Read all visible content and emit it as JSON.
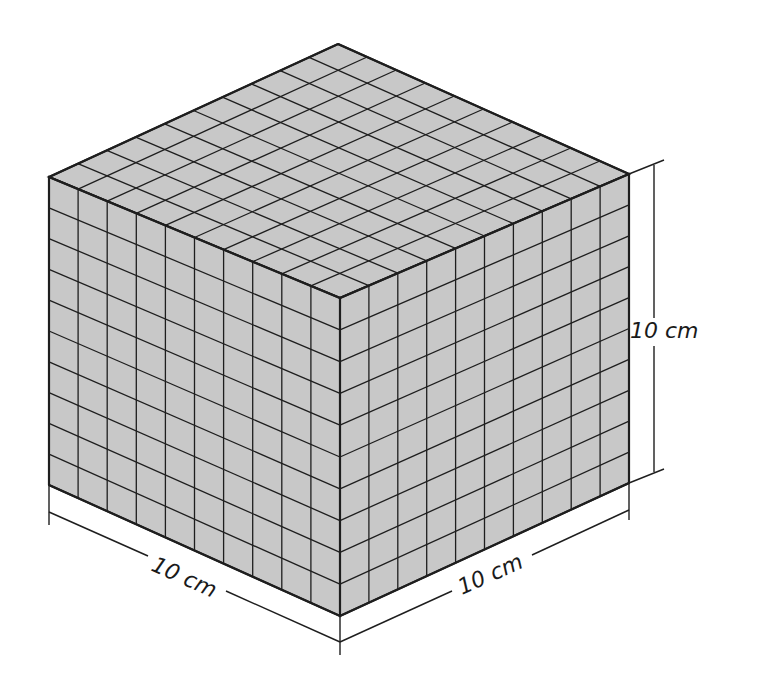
{
  "figure": {
    "type": "isometric-cube",
    "grid_divisions": 10,
    "face_fill": "#c8c8c8",
    "line_color": "#1e1e1e",
    "background": "#ffffff"
  },
  "labels": {
    "height": "10 cm",
    "width_left": "10 cm",
    "width_right": "10 cm"
  }
}
